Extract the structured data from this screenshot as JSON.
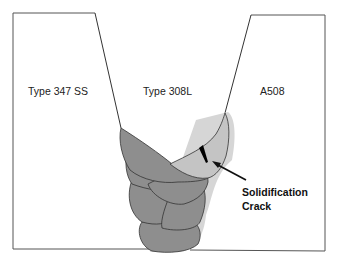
{
  "diagram": {
    "labels": {
      "left_plate": "Type 347 SS",
      "weld_metal": "Type 308L",
      "right_plate": "A508"
    },
    "callout": {
      "line1": "Solidification",
      "line2": "Crack"
    },
    "colors": {
      "weld_bead_dark": "#8e8e8e",
      "weld_bead_light": "#c4c4c4",
      "shadow": "#d6d6d6",
      "outline": "#333333",
      "crack": "#000000"
    }
  }
}
